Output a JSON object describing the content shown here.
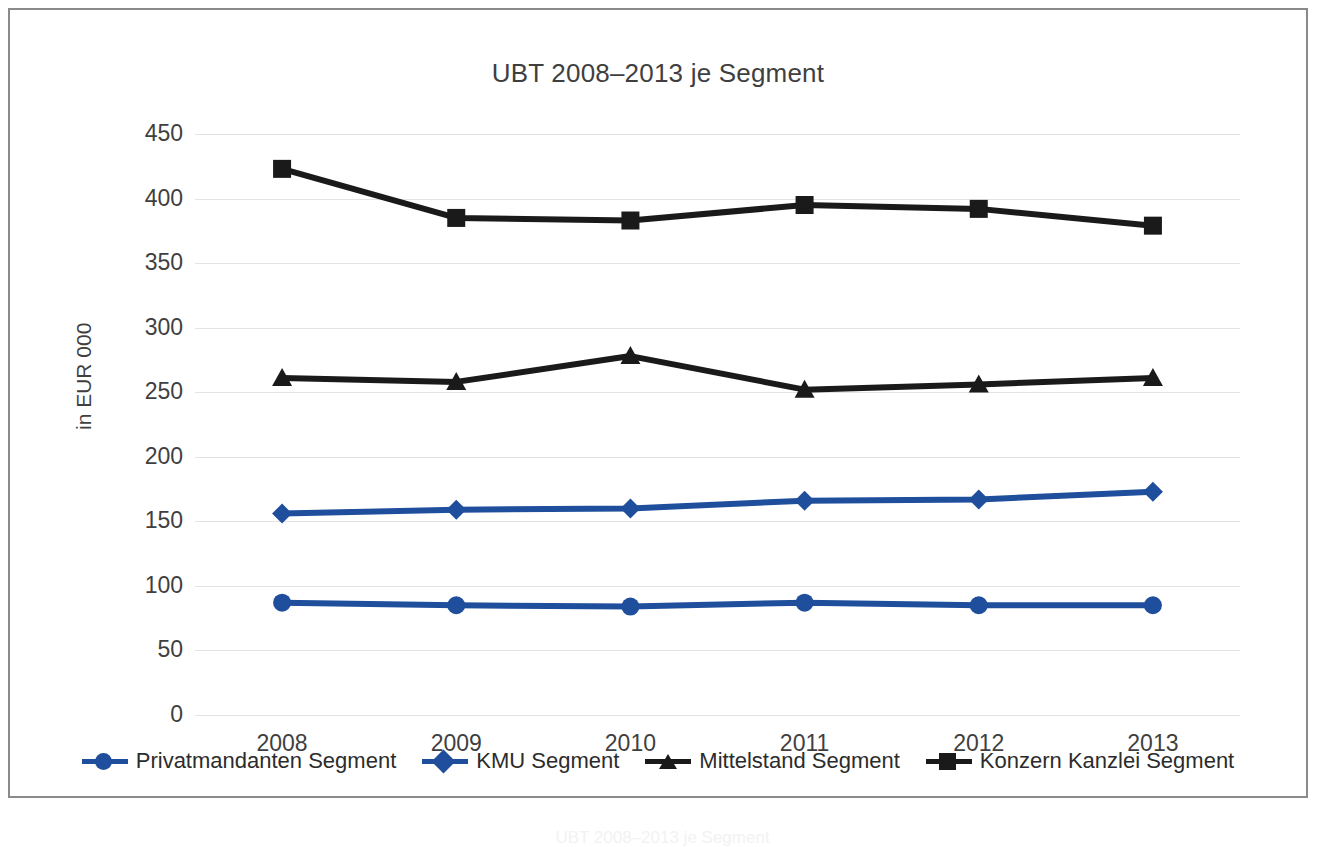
{
  "chart_data": {
    "type": "line",
    "title": "UBT 2008–2013 je Segment",
    "xlabel": "",
    "ylabel": "in EUR 000",
    "categories": [
      "2008",
      "2009",
      "2010",
      "2011",
      "2012",
      "2013"
    ],
    "ylim": [
      0,
      450
    ],
    "ytick_values": [
      0,
      50,
      100,
      150,
      200,
      250,
      300,
      350,
      400,
      450
    ],
    "ytick_labels": [
      "0",
      "50",
      "100",
      "150",
      "200",
      "250",
      "300",
      "350",
      "400",
      "450"
    ],
    "grid": true,
    "legend_position": "bottom",
    "series": [
      {
        "name": "Privatmandanten Segment",
        "color": "#1F4E9C",
        "marker": "circle",
        "values": [
          87,
          85,
          84,
          87,
          85,
          85
        ]
      },
      {
        "name": "KMU Segment",
        "color": "#1F4E9C",
        "marker": "diamond",
        "values": [
          156,
          159,
          160,
          166,
          167,
          173
        ]
      },
      {
        "name": "Mittelstand Segment",
        "color": "#1A1A1A",
        "marker": "triangle",
        "values": [
          261,
          258,
          278,
          252,
          256,
          261
        ]
      },
      {
        "name": "Konzern Kanzlei Segment",
        "color": "#1A1A1A",
        "marker": "square",
        "values": [
          423,
          385,
          383,
          395,
          392,
          379
        ]
      }
    ]
  },
  "caption": "UBT 2008–2013 je Segment"
}
